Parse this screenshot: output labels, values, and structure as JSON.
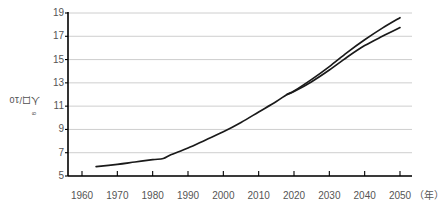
{
  "chart_data": {
    "type": "line",
    "title": "",
    "subtitle": "",
    "xlabel": "年",
    "ylabel": "人口/10⁸",
    "ylabel_text": "人口/10",
    "ylabel_exponent": "8",
    "xlim": [
      1960,
      2050
    ],
    "ylim": [
      5,
      19
    ],
    "grid": "horizontal",
    "legend": "none",
    "xticks": [
      1960,
      1970,
      1980,
      1990,
      2000,
      2010,
      2020,
      2030,
      2040,
      2050
    ],
    "xtick_labels": [
      "1960",
      "1970",
      "1980",
      "1990",
      "2000",
      "2010",
      "2020",
      "2030",
      "2040",
      "2050"
    ],
    "x_unit_label": "（年）",
    "yticks": [
      5,
      7,
      9,
      11,
      13,
      15,
      17,
      19
    ],
    "ytick_labels": [
      "5",
      "7",
      "9",
      "11",
      "13",
      "15",
      "17",
      "19"
    ],
    "series": [
      {
        "name": "上方曲线",
        "color": "#1a1a1a",
        "x": [
          1964,
          1970,
          1975,
          1980,
          1983,
          1985,
          1990,
          1995,
          2000,
          2005,
          2010,
          2015,
          2018,
          2020,
          2025,
          2030,
          2035,
          2040,
          2045,
          2050
        ],
        "values": [
          5.8,
          6.0,
          6.2,
          6.4,
          6.5,
          6.8,
          7.4,
          8.1,
          8.8,
          9.6,
          10.5,
          11.4,
          12.0,
          12.3,
          13.3,
          14.4,
          15.6,
          16.7,
          17.7,
          18.6
        ]
      },
      {
        "name": "下方曲线",
        "color": "#1a1a1a",
        "x": [
          2018,
          2020,
          2025,
          2030,
          2035,
          2040,
          2045,
          2050
        ],
        "values": [
          12.0,
          12.25,
          13.1,
          14.1,
          15.2,
          16.2,
          17.0,
          17.75
        ]
      }
    ],
    "colors": {
      "line": "#1a1a1a",
      "axis": "#000000",
      "grid": "#c8c8c8",
      "text": "#555555",
      "background": "#ffffff"
    }
  }
}
